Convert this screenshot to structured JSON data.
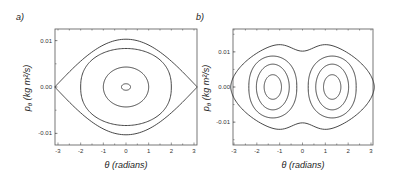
{
  "chart_data": [
    {
      "type": "line",
      "panel_label": "a)",
      "title": "",
      "xlabel": "θ (radians)",
      "ylabel": "p_θ (kg m²/s)",
      "xlim": [
        -3.1416,
        3.1416
      ],
      "ylim": [
        -0.0125,
        0.0125
      ],
      "xticks": [
        -3,
        -2,
        -1,
        0,
        1,
        2,
        3
      ],
      "xtick_labels": [
        "-3",
        "-2",
        "-1",
        "0",
        "1",
        "2",
        "3"
      ],
      "yticks": [
        0.01,
        0.0,
        -0.01
      ],
      "ytick_labels": [
        "0.01",
        "0.00",
        "-0.01"
      ],
      "grid": false,
      "description": "Phase portrait of a simple pendulum: closed orbits around origin plus separatrix",
      "series": [
        {
          "name": "orbit-small",
          "kind": "ellipse",
          "center": [
            0,
            0
          ],
          "theta_amplitude": 0.2,
          "p_amplitude": 0.0007
        },
        {
          "name": "orbit-medium",
          "kind": "ellipse",
          "center": [
            0,
            0
          ],
          "theta_amplitude": 1.0,
          "p_amplitude": 0.0043
        },
        {
          "name": "orbit-large",
          "kind": "pendulum",
          "center": [
            0,
            0
          ],
          "theta_amplitude": 2.0,
          "p_amplitude": 0.0083
        },
        {
          "name": "separatrix",
          "kind": "separatrix",
          "center": [
            0,
            0
          ],
          "theta_amplitude": 3.1416,
          "p_amplitude": 0.0103
        }
      ]
    },
    {
      "type": "line",
      "panel_label": "b)",
      "title": "",
      "xlabel": "θ (radians)",
      "ylabel": "p_θ (kg m²/s)",
      "xlim": [
        -3.1416,
        3.1416
      ],
      "ylim": [
        -0.0165,
        0.0165
      ],
      "xticks": [
        -3,
        -2,
        -1,
        0,
        1,
        2,
        3
      ],
      "xtick_labels": [
        "-3",
        "-2",
        "-1",
        "0",
        "1",
        "2",
        "3"
      ],
      "yticks": [
        0.01,
        0.0,
        -0.01
      ],
      "ytick_labels": [
        "0.01",
        "0.00",
        "-0.01"
      ],
      "grid": false,
      "description": "Double-well phase portrait: two sets of closed orbits centered near θ = ±1.3, enclosed by an outer peanut-shaped orbit",
      "series": [
        {
          "name": "left-orbit-inner",
          "kind": "ellipse",
          "center": [
            -1.3,
            0
          ],
          "theta_amplitude": 0.38,
          "p_amplitude": 0.0035
        },
        {
          "name": "left-orbit-mid",
          "kind": "ellipse",
          "center": [
            -1.3,
            0
          ],
          "theta_amplitude": 0.72,
          "p_amplitude": 0.0065
        },
        {
          "name": "left-orbit-outer",
          "kind": "well",
          "center": [
            -1.3,
            0
          ],
          "theta_amplitude": 1.05,
          "p_amplitude": 0.0088
        },
        {
          "name": "right-orbit-inner",
          "kind": "ellipse",
          "center": [
            1.3,
            0
          ],
          "theta_amplitude": 0.38,
          "p_amplitude": 0.0035
        },
        {
          "name": "right-orbit-mid",
          "kind": "ellipse",
          "center": [
            1.3,
            0
          ],
          "theta_amplitude": 0.72,
          "p_amplitude": 0.0065
        },
        {
          "name": "right-orbit-outer",
          "kind": "well",
          "center": [
            1.3,
            0
          ],
          "theta_amplitude": 1.05,
          "p_amplitude": 0.0088
        },
        {
          "name": "outer-orbit",
          "kind": "peanut",
          "center": [
            0,
            0
          ],
          "theta_amplitude": 3.1416,
          "p_amplitude": 0.0135,
          "p_at_zero": 0.0102
        }
      ]
    }
  ]
}
